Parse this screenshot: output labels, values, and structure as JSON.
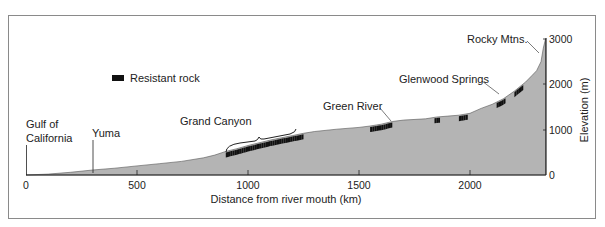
{
  "chart_data": {
    "type": "area",
    "title": "",
    "xlabel": "Distance from river mouth (km)",
    "ylabel": "Elevation (m)",
    "xlim": [
      0,
      2340
    ],
    "ylim": [
      0,
      3000
    ],
    "x_ticks": [
      0,
      500,
      1000,
      1500,
      2000
    ],
    "y_ticks": [
      0,
      1000,
      2000,
      3000
    ],
    "y_axis_position": "right",
    "grid": false,
    "fill_color": "#b4b4b4",
    "resistant_rock_color": "#111111",
    "legend": [
      {
        "label": "Resistant rock",
        "marker": "black bar"
      }
    ],
    "profile": {
      "x": [
        0,
        100,
        200,
        300,
        400,
        500,
        600,
        700,
        800,
        850,
        900,
        950,
        1000,
        1050,
        1100,
        1150,
        1200,
        1250,
        1300,
        1400,
        1500,
        1550,
        1600,
        1650,
        1700,
        1800,
        1850,
        1900,
        1950,
        2000,
        2050,
        2100,
        2150,
        2200,
        2250,
        2280,
        2300,
        2320,
        2330,
        2340
      ],
      "elevation": [
        0,
        20,
        60,
        110,
        150,
        200,
        250,
        300,
        380,
        440,
        520,
        580,
        650,
        710,
        770,
        820,
        870,
        920,
        960,
        1010,
        1050,
        1080,
        1120,
        1180,
        1210,
        1240,
        1280,
        1300,
        1320,
        1360,
        1470,
        1560,
        1680,
        1850,
        2050,
        2200,
        2300,
        2500,
        2800,
        3000
      ]
    },
    "resistant_rock_segments": [
      {
        "x_start": 900,
        "x_end": 1250,
        "region": "Grand Canyon"
      },
      {
        "x_start": 1550,
        "x_end": 1650,
        "region": "Green River"
      },
      {
        "x_start": 1840,
        "x_end": 1865
      },
      {
        "x_start": 1950,
        "x_end": 1990
      },
      {
        "x_start": 2120,
        "x_end": 2160,
        "region": "Glenwood Springs"
      },
      {
        "x_start": 2200,
        "x_end": 2240
      }
    ],
    "annotations": [
      {
        "text": "Gulf of California",
        "x": 0
      },
      {
        "text": "Yuma",
        "x": 290
      },
      {
        "text": "Grand Canyon",
        "x": 1000
      },
      {
        "text": "Green River",
        "x": 1650
      },
      {
        "text": "Glenwood Springs",
        "x": 2140
      },
      {
        "text": "Rocky Mtns.",
        "x": 2320
      }
    ]
  },
  "labels": {
    "legend": "Resistant rock",
    "gulf_line1": "Gulf of",
    "gulf_line2": "California",
    "yuma": "Yuma",
    "grand_canyon": "Grand Canyon",
    "green_river": "Green River",
    "glenwood": "Glenwood Springs",
    "rocky": "Rocky Mtns.",
    "xlabel": "Distance from river mouth (km)",
    "ylabel": "Elevation (m)",
    "xt0": "0",
    "xt1": "500",
    "xt2": "1000",
    "xt3": "1500",
    "xt4": "2000",
    "yt0": "0",
    "yt1": "1000",
    "yt2": "2000",
    "yt3": "3000"
  }
}
